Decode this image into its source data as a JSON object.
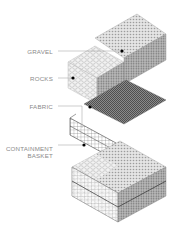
{
  "diagram": {
    "type": "exploded-isometric",
    "layers": [
      {
        "id": "gravel",
        "label": "GRAVEL",
        "pattern": "fine-dot",
        "color": "#bdbdbd"
      },
      {
        "id": "rocks",
        "label": "ROCKS",
        "pattern": "cobble",
        "color": "#dcdcdc"
      },
      {
        "id": "fabric",
        "label": "FABRIC",
        "pattern": "dense-mesh",
        "color": "#6e6e6e"
      },
      {
        "id": "basket",
        "label_line1": "CONTAINMENT",
        "label_line2": "BASKET",
        "pattern": "wire-grid",
        "color": "#555555"
      }
    ],
    "colors": {
      "text": "#8a8a8a",
      "leader": "#9a9a9a",
      "dot": "#000000",
      "outline": "#7a7a7a"
    }
  }
}
